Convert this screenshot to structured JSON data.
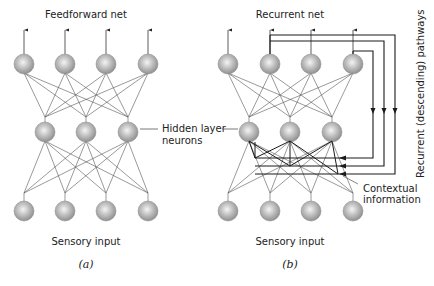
{
  "panel_a": {
    "title": "Feedforward net",
    "input_label": "Sensory input",
    "caption": "(a)",
    "output_neurons": [
      24,
      65,
      106,
      148
    ],
    "hidden_neurons": [
      45,
      86,
      128
    ],
    "input_neurons": [
      24,
      65,
      106,
      148
    ]
  },
  "panel_b": {
    "title": "Recurrent net",
    "input_label": "Sensory input",
    "caption": "(b)",
    "output_neurons": [
      228,
      270,
      311,
      353
    ],
    "hidden_neurons": [
      249,
      290,
      332
    ],
    "input_neurons": [
      228,
      270,
      311,
      353
    ],
    "pathway_label": "Recurrent (descending) pathways",
    "context_label_line1": "Contextual",
    "context_label_line2": "information"
  },
  "shared": {
    "hidden_label_line1": "Hidden layer",
    "hidden_label_line2": "neurons"
  },
  "layout": {
    "output_y": 64,
    "hidden_y": 132,
    "input_y": 211,
    "neuron_radius": 10
  },
  "colors": {
    "neuron_fill": "#a8a8a8",
    "neuron_highlight": "#f2f2f2",
    "line": "#555555",
    "dark_line": "#1a1a1a"
  }
}
